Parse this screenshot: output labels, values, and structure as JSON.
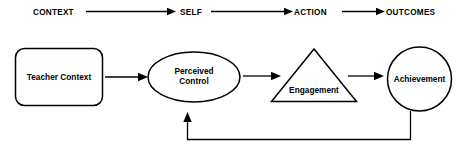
{
  "diagram": {
    "colors": {
      "stroke": "#000000",
      "background": "#ffffff",
      "text": "#000000"
    },
    "stage_row": {
      "stages": [
        {
          "label": "CONTEXT"
        },
        {
          "label": "SELF"
        },
        {
          "label": "ACTION"
        },
        {
          "label": "OUTCOMES"
        }
      ],
      "connector_count": 3
    },
    "nodes": [
      {
        "id": "teacher-context",
        "label": "Teacher Context",
        "shape": "rounded-rectangle"
      },
      {
        "id": "perceived-control",
        "label_line1": "Perceived",
        "label_line2": "Control",
        "shape": "ellipse"
      },
      {
        "id": "engagement",
        "label": "Engagement",
        "shape": "triangle"
      },
      {
        "id": "achievement",
        "label": "Achievement",
        "shape": "circle"
      }
    ],
    "connectors": [
      {
        "from": "teacher-context",
        "to": "perceived-control",
        "style": "arrow"
      },
      {
        "from": "perceived-control",
        "to": "engagement",
        "style": "arrow"
      },
      {
        "from": "engagement",
        "to": "achievement",
        "style": "arrow"
      }
    ],
    "feedback_loop": {
      "from": "achievement",
      "to": "perceived-control",
      "style": "arrow",
      "routing": "down-left-up"
    }
  }
}
